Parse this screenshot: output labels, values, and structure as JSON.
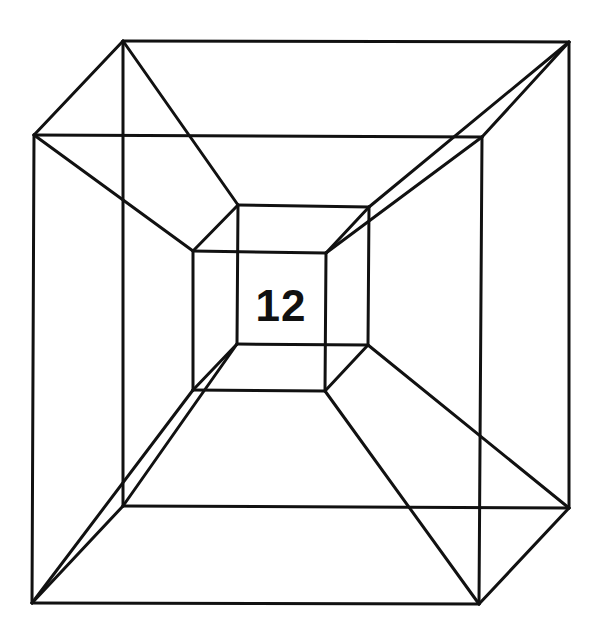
{
  "diagram": {
    "type": "tesseract-line-drawing",
    "label": "12",
    "colors": {
      "stroke": "#111111",
      "background": "#ffffff"
    },
    "vertices": {
      "outer_back_tl": [
        123,
        41
      ],
      "outer_back_tr": [
        569,
        42
      ],
      "outer_back_br": [
        569,
        508
      ],
      "outer_back_bl": [
        123,
        506
      ],
      "outer_front_tl": [
        34,
        135
      ],
      "outer_front_tr": [
        482,
        137
      ],
      "outer_front_br": [
        479,
        604
      ],
      "outer_front_bl": [
        32,
        603
      ],
      "inner_back_tl": [
        238,
        205
      ],
      "inner_back_tr": [
        369,
        207
      ],
      "inner_back_br": [
        368,
        345
      ],
      "inner_back_bl": [
        237,
        344
      ],
      "inner_front_tl": [
        193,
        251
      ],
      "inner_front_tr": [
        326,
        253
      ],
      "inner_front_br": [
        325,
        391
      ],
      "inner_front_bl": [
        193,
        390
      ]
    },
    "edges": [
      [
        "outer_back_tl",
        "outer_back_tr"
      ],
      [
        "outer_back_tr",
        "outer_back_br"
      ],
      [
        "outer_back_br",
        "outer_back_bl"
      ],
      [
        "outer_back_bl",
        "outer_back_tl"
      ],
      [
        "outer_front_tl",
        "outer_front_tr"
      ],
      [
        "outer_front_tr",
        "outer_front_br"
      ],
      [
        "outer_front_br",
        "outer_front_bl"
      ],
      [
        "outer_front_bl",
        "outer_front_tl"
      ],
      [
        "outer_back_tl",
        "outer_front_tl"
      ],
      [
        "outer_back_tr",
        "outer_front_tr"
      ],
      [
        "outer_back_br",
        "outer_front_br"
      ],
      [
        "outer_back_bl",
        "outer_front_bl"
      ],
      [
        "inner_back_tl",
        "inner_back_tr"
      ],
      [
        "inner_back_tr",
        "inner_back_br"
      ],
      [
        "inner_back_br",
        "inner_back_bl"
      ],
      [
        "inner_back_bl",
        "inner_back_tl"
      ],
      [
        "inner_front_tl",
        "inner_front_tr"
      ],
      [
        "inner_front_tr",
        "inner_front_br"
      ],
      [
        "inner_front_br",
        "inner_front_bl"
      ],
      [
        "inner_front_bl",
        "inner_front_tl"
      ],
      [
        "inner_back_tl",
        "inner_front_tl"
      ],
      [
        "inner_back_tr",
        "inner_front_tr"
      ],
      [
        "inner_back_br",
        "inner_front_br"
      ],
      [
        "inner_back_bl",
        "inner_front_bl"
      ],
      [
        "outer_back_tl",
        "inner_back_tl"
      ],
      [
        "outer_back_tr",
        "inner_back_tr"
      ],
      [
        "outer_back_br",
        "inner_back_br"
      ],
      [
        "outer_back_bl",
        "inner_back_bl"
      ],
      [
        "outer_front_tl",
        "inner_front_tl"
      ],
      [
        "outer_front_tr",
        "inner_front_tr"
      ],
      [
        "outer_front_br",
        "inner_front_br"
      ],
      [
        "outer_front_bl",
        "inner_front_bl"
      ]
    ]
  }
}
